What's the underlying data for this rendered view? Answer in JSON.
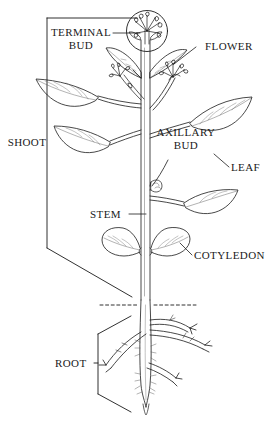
{
  "diagram": {
    "style": {
      "ink_color": "#1a1a1a",
      "background_color": "#ffffff",
      "line_weight": "thin"
    },
    "soil_line": {
      "name": "soil-line",
      "style": "dashed",
      "description": "horizontal dashed line marking the ground surface"
    },
    "labels": [
      {
        "id": "terminal-bud",
        "text_lines": [
          "TERMINAL",
          "BUD"
        ],
        "text": "TERMINAL BUD",
        "side": "left",
        "leader": "horizontal line to the circled bud at the shoot apex"
      },
      {
        "id": "flower",
        "text_lines": [
          "FLOWER"
        ],
        "text": "FLOWER",
        "side": "right",
        "leader": "diagonal line down-left to the flower cluster"
      },
      {
        "id": "shoot",
        "text_lines": [
          "SHOOT"
        ],
        "text": "SHOOT",
        "side": "left",
        "leader": "tall vertical bracket spanning the entire above-ground portion"
      },
      {
        "id": "axillary-bud",
        "text_lines": [
          "AXILLARY",
          "BUD"
        ],
        "text": "AXILLARY BUD",
        "side": "inner",
        "leader": "curved line down-left to the bud in the leaf axil"
      },
      {
        "id": "leaf",
        "text_lines": [
          "LEAF"
        ],
        "text": "LEAF",
        "side": "right",
        "leader": "short diagonal line up-left to the leaf blade"
      },
      {
        "id": "stem",
        "text_lines": [
          "STEM"
        ],
        "text": "STEM",
        "side": "left",
        "leader": "horizontal line right to the main stem"
      },
      {
        "id": "cotyledon",
        "text_lines": [
          "COTYLEDON"
        ],
        "text": "COTYLEDON",
        "side": "right",
        "leader": "short diagonal line up-left to the seed leaf"
      },
      {
        "id": "root",
        "text_lines": [
          "ROOT"
        ],
        "text": "ROOT",
        "side": "left",
        "leader": "short line to a bracket spanning the below-ground root system"
      }
    ]
  }
}
